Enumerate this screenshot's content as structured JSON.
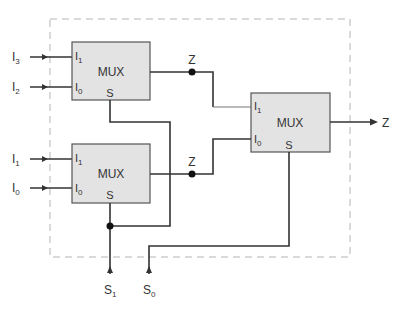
{
  "diagram": {
    "colors": {
      "wire": "#333333",
      "box_fill": "#e3e3e3",
      "boundary": "#b5b5b5"
    },
    "muxes": [
      {
        "id": "mux-top",
        "label": "MUX",
        "pins": {
          "i1": "I",
          "i1_sub": "1",
          "i0": "I",
          "i0_sub": "0",
          "s": "S"
        }
      },
      {
        "id": "mux-bottom",
        "label": "MUX",
        "pins": {
          "i1": "I",
          "i1_sub": "1",
          "i0": "I",
          "i0_sub": "0",
          "s": "S"
        }
      },
      {
        "id": "mux-final",
        "label": "MUX",
        "pins": {
          "i1": "I",
          "i1_sub": "1",
          "i0": "I",
          "i0_sub": "0",
          "s": "S"
        }
      }
    ],
    "inputs": [
      {
        "name": "I",
        "sub": "3"
      },
      {
        "name": "I",
        "sub": "2"
      },
      {
        "name": "I",
        "sub": "1"
      },
      {
        "name": "I",
        "sub": "0"
      }
    ],
    "selects": [
      {
        "name": "S",
        "sub": "1"
      },
      {
        "name": "S",
        "sub": "0"
      }
    ],
    "intermediate_outputs": [
      "Z",
      "Z"
    ],
    "output": "Z"
  }
}
